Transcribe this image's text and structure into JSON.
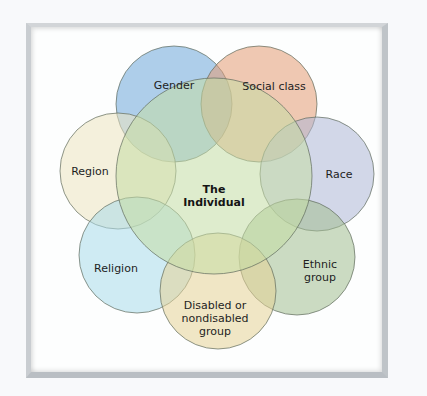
{
  "diagram": {
    "type": "venn-flower",
    "center": {
      "label_line1": "The",
      "label_line2": "Individual",
      "color": "#cfe3b4"
    },
    "petals": [
      {
        "id": "gender",
        "label": "Gender",
        "color": "#86b4dc"
      },
      {
        "id": "social-class",
        "label": "Social class",
        "color": "#e9a985"
      },
      {
        "id": "region",
        "label": "Region",
        "color": "#f1ecd2"
      },
      {
        "id": "race",
        "label": "Race",
        "color": "#bfc6dd"
      },
      {
        "id": "religion",
        "label": "Religion",
        "color": "#bfe3ee"
      },
      {
        "id": "ethnic-group",
        "label_line1": "Ethnic",
        "label_line2": "group",
        "color": "#b6cba6"
      },
      {
        "id": "disabled",
        "label_line1": "Disabled or",
        "label_line2": "nondisabled",
        "label_line3": "group",
        "color": "#ecdcac"
      }
    ],
    "outline_color": "#6f7a6a"
  }
}
